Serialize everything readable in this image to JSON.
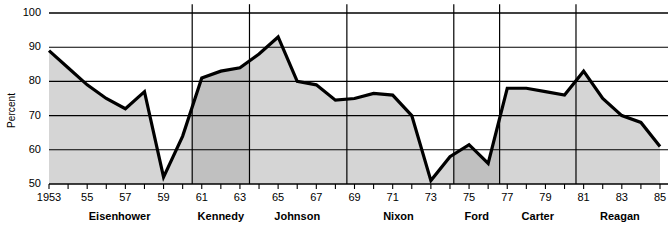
{
  "chart_data": {
    "type": "area",
    "title": "",
    "subtitle": "",
    "xlabel": "",
    "ylabel": "Percent",
    "xlim": [
      1953,
      1985
    ],
    "ylim": [
      50,
      100
    ],
    "grid": "horizontal",
    "legend": "none",
    "yticks": [
      100,
      90,
      80,
      70,
      60,
      50
    ],
    "ytick_labels": [
      "100",
      "90",
      "80",
      "70",
      "60",
      "50"
    ],
    "xticks": [
      1953,
      1954,
      1955,
      1956,
      1957,
      1958,
      1959,
      1960,
      1961,
      1962,
      1963,
      1964,
      1965,
      1966,
      1967,
      1968,
      1969,
      1970,
      1971,
      1972,
      1973,
      1974,
      1975,
      1976,
      1977,
      1978,
      1979,
      1980,
      1981,
      1982,
      1983,
      1984,
      1985
    ],
    "xtick_labels": [
      "1953",
      "",
      "55",
      "",
      "57",
      "",
      "59",
      "",
      "61",
      "",
      "63",
      "",
      "65",
      "",
      "67",
      "",
      "69",
      "",
      "71",
      "",
      "73",
      "",
      "75",
      "",
      "77",
      "",
      "79",
      "",
      "81",
      "",
      "83",
      "",
      "85"
    ],
    "series": [
      {
        "name": "Percent",
        "x": [
          1953,
          1954,
          1955,
          1956,
          1957,
          1958,
          1959,
          1960,
          1961,
          1962,
          1963,
          1964,
          1965,
          1966,
          1967,
          1968,
          1969,
          1970,
          1971,
          1972,
          1973,
          1974,
          1975,
          1976,
          1977,
          1978,
          1979,
          1980,
          1981,
          1982,
          1983,
          1984,
          1985
        ],
        "values": [
          89,
          84,
          79,
          75,
          72,
          77,
          52,
          64,
          81,
          83,
          84,
          88,
          93,
          80,
          79,
          74.5,
          75,
          76.5,
          76,
          70,
          51,
          58,
          61.5,
          56,
          78,
          78,
          77,
          76,
          83,
          75,
          70,
          68,
          61
        ]
      }
    ],
    "annotations": {
      "administrations": [
        {
          "name": "Eisenhower",
          "start": 1953,
          "end": 1960.5,
          "label_x": 1956.7,
          "shade": "light"
        },
        {
          "name": "Kennedy",
          "start": 1960.5,
          "end": 1963.5,
          "label_x": 1962.0,
          "shade": "dark"
        },
        {
          "name": "Johnson",
          "start": 1963.5,
          "end": 1968.6,
          "label_x": 1966.0,
          "shade": "light"
        },
        {
          "name": "Nixon",
          "start": 1968.6,
          "end": 1974.2,
          "label_x": 1971.3,
          "shade": "light"
        },
        {
          "name": "Ford",
          "start": 1974.2,
          "end": 1976.6,
          "label_x": 1975.4,
          "shade": "dark"
        },
        {
          "name": "Carter",
          "start": 1976.6,
          "end": 1980.6,
          "label_x": 1978.6,
          "shade": "light"
        },
        {
          "name": "Reagan",
          "start": 1980.6,
          "end": 1985,
          "label_x": 1982.9,
          "shade": "light"
        }
      ]
    },
    "colors": {
      "line": "#000000",
      "area_light": "#d5d5d5",
      "area_dark": "#c0c0c0",
      "gridline": "#000000",
      "background": "#ffffff",
      "axis": "#000000"
    }
  },
  "axis": {
    "y_title": "Percent"
  }
}
